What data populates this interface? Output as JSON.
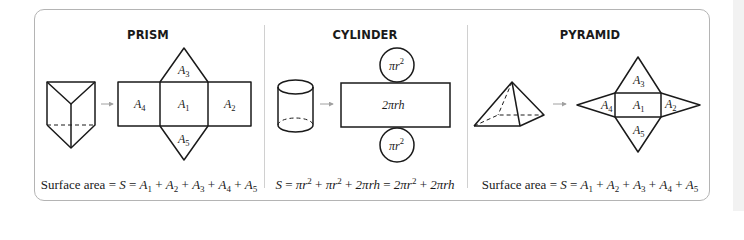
{
  "colors": {
    "stroke": "#1a1a1a",
    "frame": "#b4b4b4",
    "divider": "#d0d0d0",
    "arrow": "#a0a0a0"
  },
  "panels": [
    {
      "title": "PRISM",
      "center_x": 148,
      "net_labels": [
        {
          "name": "A",
          "sub": "1",
          "x": 178,
          "y": 108
        },
        {
          "name": "A",
          "sub": "2",
          "x": 223,
          "y": 108
        },
        {
          "name": "A",
          "sub": "3",
          "x": 178,
          "y": 73
        },
        {
          "name": "A",
          "sub": "4",
          "x": 132,
          "y": 108
        },
        {
          "name": "A",
          "sub": "5",
          "x": 178,
          "y": 142
        }
      ],
      "formula_prefix": "Surface area = ",
      "formula_terms": [
        "1",
        "2",
        "3",
        "4",
        "5"
      ]
    },
    {
      "title": "CYLINDER",
      "center_x": 365,
      "net_labels": [
        {
          "text": "πr",
          "sup": "2",
          "x": 397,
          "y": 69
        },
        {
          "text": "2πrh",
          "x": 397,
          "y": 109
        },
        {
          "text": "πr",
          "sup": "2",
          "x": 397,
          "y": 149
        }
      ],
      "formula": "S = πr² + πr² + 2πrh = 2πr² + 2πrh"
    },
    {
      "title": "PYRAMID",
      "center_x": 590,
      "net_labels": [
        {
          "name": "A",
          "sub": "1",
          "x": 635,
          "y": 109
        },
        {
          "name": "A",
          "sub": "2",
          "x": 670,
          "y": 109
        },
        {
          "name": "A",
          "sub": "3",
          "x": 635,
          "y": 82
        },
        {
          "name": "A",
          "sub": "4",
          "x": 600,
          "y": 109
        },
        {
          "name": "A",
          "sub": "5",
          "x": 635,
          "y": 133
        }
      ],
      "formula_prefix": "Surface area = ",
      "formula_terms": [
        "1",
        "2",
        "3",
        "4",
        "5"
      ]
    }
  ],
  "texts": {
    "prism_title": "PRISM",
    "cylinder_title": "CYLINDER",
    "pyramid_title": "PYRAMID",
    "prism_formula_prefix": "Surface area = ",
    "pyramid_formula_prefix": "Surface area = ",
    "S": "S",
    "eq": " = ",
    "A": "A",
    "plus": " + ",
    "pi_r": "πr",
    "two_pi_r": "2πr",
    "two_pi_rh": "2πrh",
    "sq": "2"
  }
}
